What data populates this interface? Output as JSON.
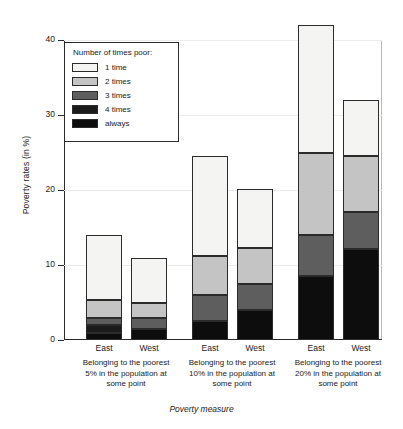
{
  "chart_data": {
    "type": "bar",
    "stacked": true,
    "title": "",
    "xlabel": "Poverty measure",
    "ylabel": "Poverty rates (in %)",
    "ylim": [
      0,
      40
    ],
    "yticks": [
      0,
      10,
      20,
      30,
      40
    ],
    "ytick_labels": [
      "0",
      "10",
      "20",
      "30",
      "40"
    ],
    "grid": false,
    "legend_title": "Number of times poor:",
    "legend_position": "top-left-inside",
    "categories": [
      "East",
      "West",
      "East",
      "West",
      "East",
      "West"
    ],
    "groups": [
      {
        "label_lines": [
          "Belonging to the poorest",
          "5% in the population at",
          "some point"
        ],
        "bars": [
          "East",
          "West"
        ]
      },
      {
        "label_lines": [
          "Belonging to the poorest",
          "10% in the population at",
          "some point"
        ],
        "bars": [
          "East",
          "West"
        ]
      },
      {
        "label_lines": [
          "Belonging to the poorest",
          "20% in the population at",
          "some point"
        ],
        "bars": [
          "East",
          "West"
        ]
      }
    ],
    "series": [
      {
        "name": "1 time",
        "color": "#f4f4f2",
        "values": [
          8.7,
          6.0,
          13.3,
          7.8,
          17.0,
          7.5
        ]
      },
      {
        "name": "2 times",
        "color": "#c4c4c4",
        "values": [
          2.3,
          2.0,
          5.2,
          4.8,
          11.0,
          7.4
        ]
      },
      {
        "name": "3 times",
        "color": "#5e5e5e",
        "values": [
          1.0,
          1.5,
          3.5,
          3.5,
          5.5,
          5.0
        ]
      },
      {
        "name": "4 times",
        "color": "#1b1b1b",
        "values": [
          1.0,
          0.0,
          0.0,
          0.0,
          0.0,
          0.0
        ]
      },
      {
        "name": "always",
        "color": "#0d0d0d",
        "values": [
          1.0,
          1.5,
          2.5,
          4.0,
          8.5,
          12.1
        ]
      }
    ],
    "totals": [
      14.0,
      11.0,
      24.5,
      20.1,
      42.0,
      32.0
    ]
  },
  "legend": {
    "title": "Number of times poor:",
    "items": [
      {
        "label": "1 time",
        "color": "#f4f4f2"
      },
      {
        "label": "2 times",
        "color": "#c4c4c4"
      },
      {
        "label": "3 times",
        "color": "#5e5e5e"
      },
      {
        "label": "4 times",
        "color": "#1b1b1b"
      },
      {
        "label": "always",
        "color": "#0d0d0d"
      }
    ]
  },
  "axes": {
    "y_title": "Poverty rates (in %)",
    "x_title": "Poverty measure"
  }
}
